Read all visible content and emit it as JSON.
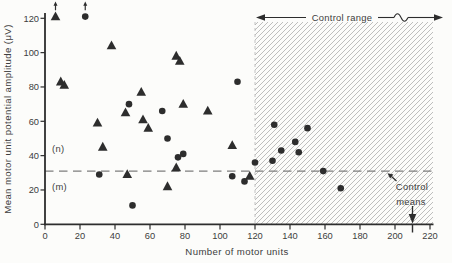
{
  "chart_data": {
    "type": "scatter",
    "title": "",
    "xlabel": "Number of motor units",
    "ylabel": "Mean motor unit potential amplitude (μV)",
    "xlim": [
      0,
      220
    ],
    "ylim": [
      0,
      120
    ],
    "x_ticks": [
      0,
      20,
      40,
      60,
      80,
      100,
      120,
      140,
      160,
      180,
      200,
      220
    ],
    "y_ticks": [
      0,
      20,
      40,
      60,
      80,
      100,
      120
    ],
    "grid": false,
    "point_format": [
      "x",
      "y",
      "offscale_up_arrow"
    ],
    "series": [
      {
        "name": "triangle-points",
        "marker": "triangle",
        "points": [
          [
            6,
            121,
            1
          ],
          [
            9,
            83
          ],
          [
            11,
            81
          ],
          [
            38,
            104
          ],
          [
            75,
            98
          ],
          [
            77,
            95
          ],
          [
            55,
            77
          ],
          [
            79,
            70
          ],
          [
            93,
            66
          ],
          [
            107,
            46
          ],
          [
            46,
            65
          ],
          [
            56,
            61
          ],
          [
            59,
            56
          ],
          [
            30,
            59
          ],
          [
            33,
            45
          ],
          [
            47,
            29
          ],
          [
            75,
            33
          ],
          [
            70,
            22
          ],
          [
            117,
            28
          ]
        ]
      },
      {
        "name": "circle-points",
        "marker": "circle",
        "points": [
          [
            23,
            121,
            1
          ],
          [
            48,
            70
          ],
          [
            67,
            66
          ],
          [
            110,
            83
          ],
          [
            70,
            50
          ],
          [
            76,
            39
          ],
          [
            79,
            41
          ],
          [
            31,
            29
          ],
          [
            50,
            11
          ],
          [
            107,
            28
          ],
          [
            114,
            25
          ],
          [
            120,
            36
          ],
          [
            130,
            37
          ],
          [
            135,
            43
          ],
          [
            145,
            42
          ],
          [
            143,
            48
          ],
          [
            131,
            58
          ],
          [
            150,
            56
          ],
          [
            159,
            31
          ],
          [
            169,
            21
          ]
        ]
      }
    ],
    "annotations": {
      "control_range_label": "Control range",
      "control_range_x_start": 120,
      "control_range_x_end": 220,
      "control_means_line1": "Control",
      "control_means_line2": "means",
      "dashed_mean_line_y": 31,
      "control_mean_x": 210,
      "upper_region_label": "(n)",
      "lower_region_label": "(m)"
    }
  },
  "colors": {
    "marker": "#2d2d2d",
    "axis": "#2d2d2d",
    "text": "#3d3d3d",
    "hatch_line": "#a3a3a3",
    "dashed_line": "#7d7d7d",
    "background": "#fcfcfa"
  }
}
